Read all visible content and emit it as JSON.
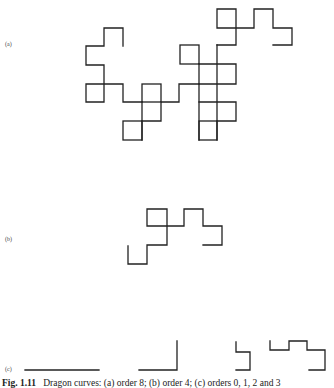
{
  "figure": {
    "panels": [
      {
        "label": "(a)",
        "description": "Dragon curve, order 8"
      },
      {
        "label": "(b)",
        "description": "Dragon curve, order 4"
      },
      {
        "label": "(c)",
        "description": "Dragon curves, orders 0, 1, 2 and 3"
      }
    ],
    "caption": {
      "number": "Fig. 1.11",
      "text": "Dragon curves: (a) order 8; (b) order 4; (c) orders 0, 1, 2 and 3"
    },
    "line_color": "#222222",
    "background": "#ffffff"
  }
}
